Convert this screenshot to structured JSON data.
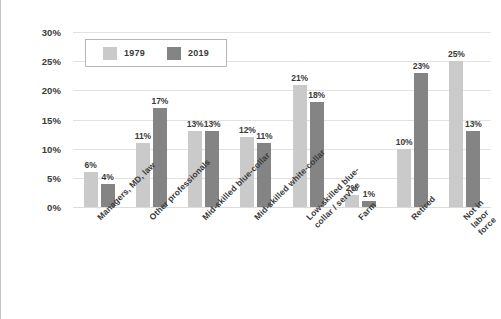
{
  "chart_data": {
    "type": "bar",
    "title": "",
    "xlabel": "",
    "ylabel": "",
    "ylim": [
      0,
      30
    ],
    "yticks": [
      "0%",
      "5%",
      "10%",
      "15%",
      "20%",
      "25%",
      "30%"
    ],
    "ytick_values": [
      0,
      5,
      10,
      15,
      20,
      25,
      30
    ],
    "grid": true,
    "legend_position": "top-left-inside",
    "categories": [
      "Managers, MD, law",
      "Other professionals",
      "Mid-skilled blue-collar",
      "Mid-skilled white-collar",
      "Low-skilled blue-\ncollar / service",
      "Farm",
      "Retired",
      "Not in labor force"
    ],
    "series": [
      {
        "name": "1979",
        "color": "#cacaca",
        "values": [
          6,
          11,
          13,
          12,
          21,
          2,
          10,
          25
        ],
        "labels": [
          "6%",
          "11%",
          "13%",
          "12%",
          "21%",
          "2%",
          "10%",
          "25%"
        ]
      },
      {
        "name": "2019",
        "color": "#848484",
        "values": [
          4,
          17,
          13,
          11,
          18,
          1,
          23,
          13
        ],
        "labels": [
          "4%",
          "17%",
          "13%",
          "11%",
          "18%",
          "1%",
          "23%",
          "13%"
        ]
      }
    ]
  },
  "colors": {
    "series_1979": "#cacaca",
    "series_2019": "#848484",
    "gridline": "#e2e2e2",
    "text": "#3a3a3a",
    "background": "#ffffff",
    "legend_border": "#b6b6b6",
    "frame_border": "#c4c4c4"
  }
}
